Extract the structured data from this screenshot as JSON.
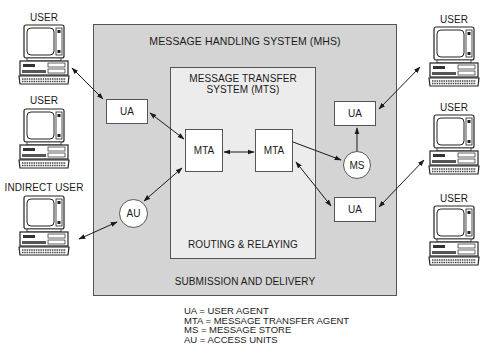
{
  "diagram": {
    "title": "MESSAGE HANDLING SYSTEM (MHS)",
    "mts_title_line1": "MESSAGE TRANSFER",
    "mts_title_line2": "SYSTEM (MTS)",
    "mts_footer": "ROUTING & RELAYING",
    "mhs_footer": "SUBMISSION AND DELIVERY",
    "nodes": {
      "ua_left": "UA",
      "mta_left": "MTA",
      "mta_right": "MTA",
      "ua_right_top": "UA",
      "ms": "MS",
      "ua_right_bottom": "UA",
      "au": "AU"
    },
    "users": {
      "left_top": "USER",
      "left_middle": "USER",
      "left_bottom": "INDIRECT USER",
      "right_top": "USER",
      "right_middle": "USER",
      "right_bottom": "USER"
    },
    "legend": [
      "UA = USER AGENT",
      "MTA = MESSAGE TRANSFER AGENT",
      "MS = MESSAGE STORE",
      "AU = ACCESS UNITS"
    ],
    "colors": {
      "mhs_fill": "#d4d4d4",
      "mts_fill": "#ececec",
      "node_fill": "#ffffff",
      "line": "#1a1a1a"
    }
  }
}
